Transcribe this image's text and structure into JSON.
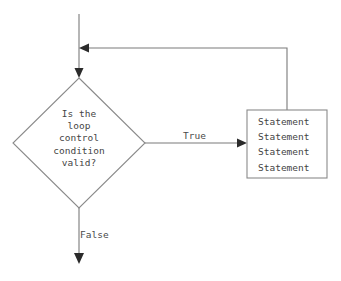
{
  "diagram": {
    "type": "flowchart",
    "background_color": "#ffffff",
    "line_color": "#7a7a7a",
    "text_color": "#454545",
    "nodes": {
      "decision": {
        "shape": "diamond",
        "text": "Is the\nloop\ncontrol\ncondition\nvalid?"
      },
      "process": {
        "shape": "rectangle",
        "text": "Statement\nStatement\nStatement\nStatement",
        "lines": [
          "Statement",
          "Statement",
          "Statement",
          "Statement"
        ]
      }
    },
    "edges": {
      "entry": {
        "label": ""
      },
      "true_branch": {
        "label": "True"
      },
      "false_branch": {
        "label": "False"
      },
      "feedback": {
        "label": ""
      }
    }
  }
}
